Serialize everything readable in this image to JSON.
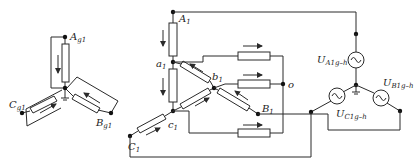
{
  "diagram": {
    "left_network": {
      "nodes": [
        {
          "main": "A",
          "sub": "g1"
        },
        {
          "main": "C",
          "sub": "g1"
        },
        {
          "main": "B",
          "sub": "g1"
        }
      ]
    },
    "middle_network": {
      "nodes": [
        {
          "main": "A",
          "sub": "1"
        },
        {
          "main": "a",
          "sub": "1"
        },
        {
          "main": "b",
          "sub": "1"
        },
        {
          "main": "B",
          "sub": "1"
        },
        {
          "main": "c",
          "sub": "1"
        },
        {
          "main": "C",
          "sub": "1"
        }
      ],
      "junction": {
        "main": "o",
        "sub": ""
      }
    },
    "sources": [
      {
        "main": "U",
        "sub": "A1g–h",
        "symbol": "ac-source"
      },
      {
        "main": "U",
        "sub": "B1g–h",
        "symbol": "ac-source"
      },
      {
        "main": "U",
        "sub": "C1g–h",
        "symbol": "ac-source"
      }
    ]
  }
}
